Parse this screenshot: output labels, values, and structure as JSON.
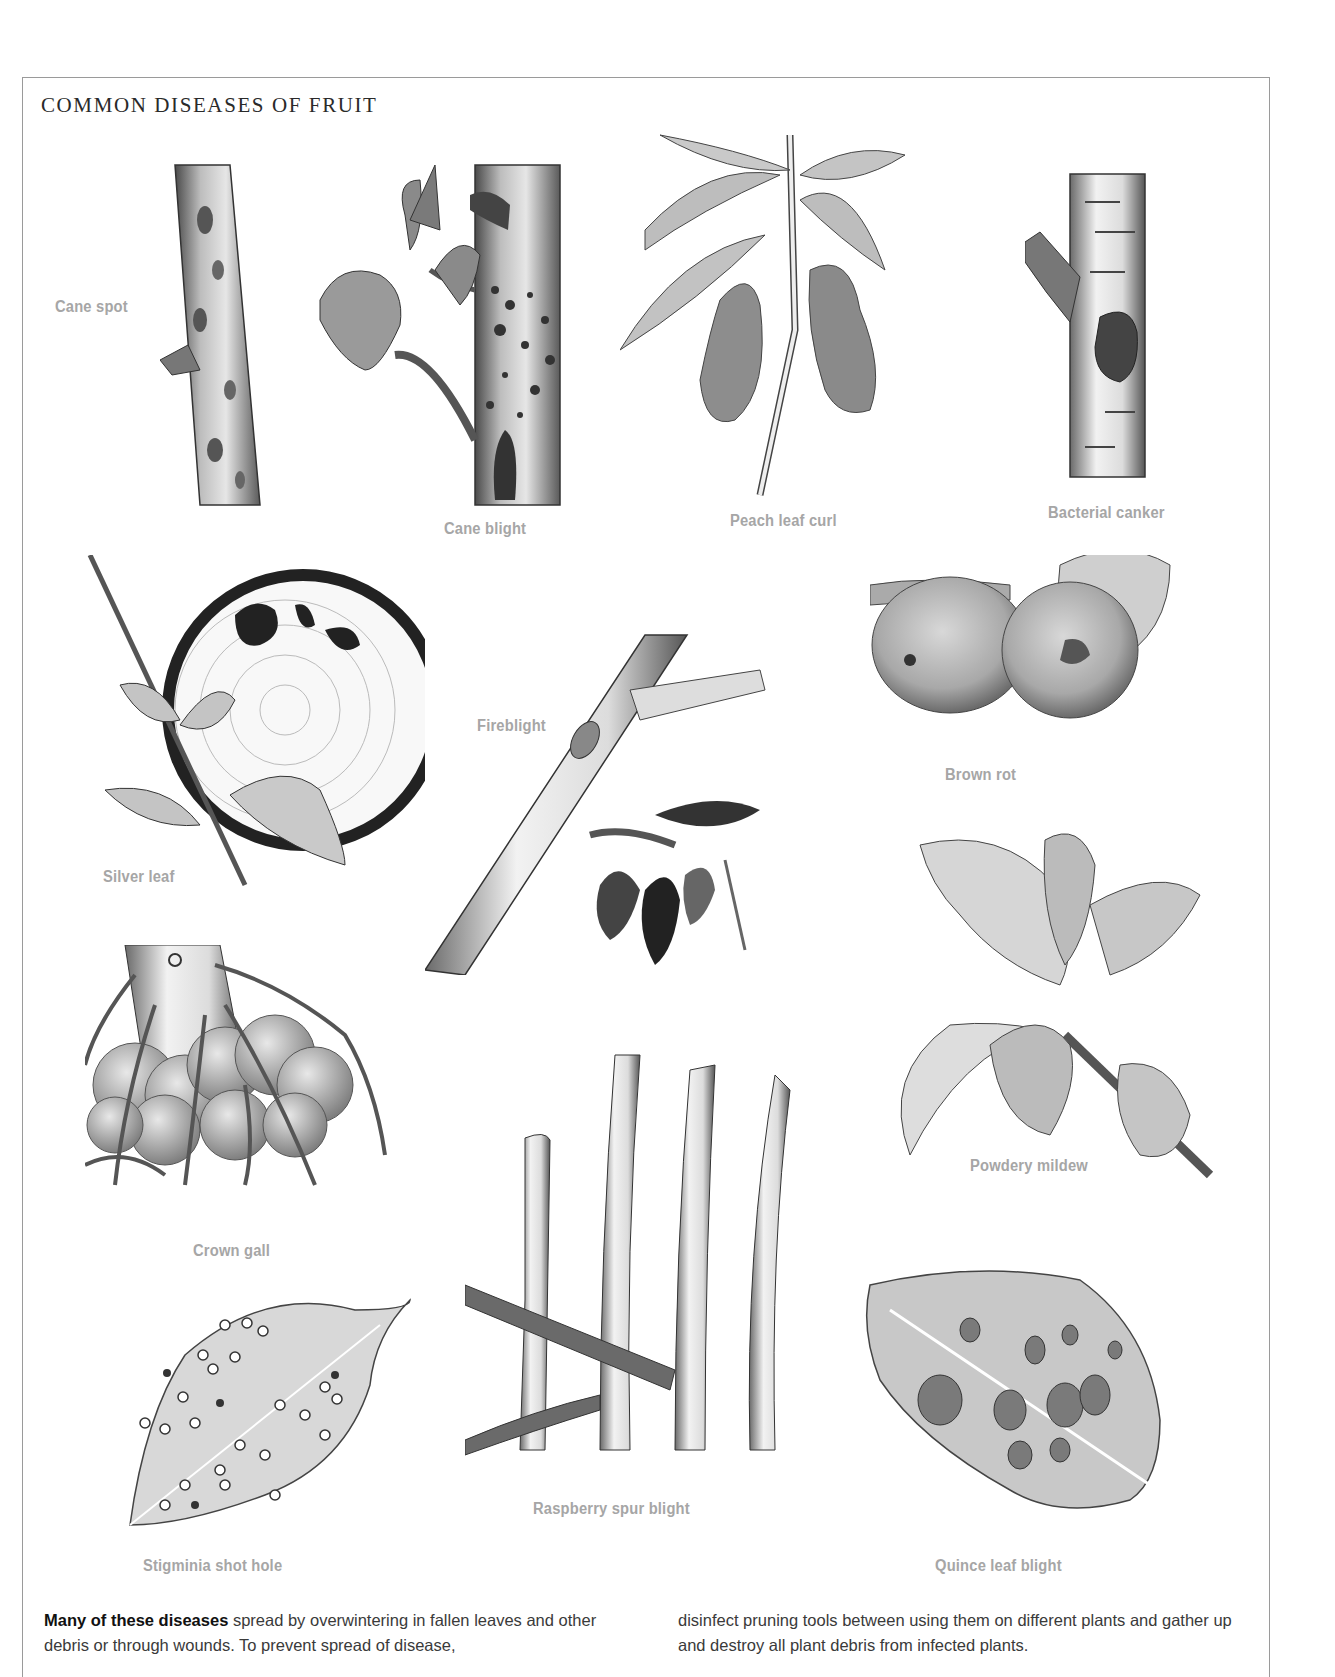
{
  "page": {
    "title": "COMMON DISEASES OF FRUIT",
    "label_color": "#a6a6a6",
    "border_color": "#9a9a9a"
  },
  "diseases": [
    {
      "id": "cane-spot",
      "label": "Cane spot"
    },
    {
      "id": "cane-blight",
      "label": "Cane blight"
    },
    {
      "id": "peach-leaf-curl",
      "label": "Peach leaf curl"
    },
    {
      "id": "bacterial-canker",
      "label": "Bacterial canker"
    },
    {
      "id": "silver-leaf",
      "label": "Silver leaf"
    },
    {
      "id": "fireblight",
      "label": "Fireblight"
    },
    {
      "id": "brown-rot",
      "label": "Brown rot"
    },
    {
      "id": "powdery-mildew",
      "label": "Powdery mildew"
    },
    {
      "id": "crown-gall",
      "label": "Crown gall"
    },
    {
      "id": "raspberry-spur-blight",
      "label": "Raspberry spur blight"
    },
    {
      "id": "stigminia-shot-hole",
      "label": "Stigminia shot hole"
    },
    {
      "id": "quince-leaf-blight",
      "label": "Quince leaf blight"
    }
  ],
  "caption": {
    "bold_lead": "Many of these diseases",
    "left_text": " spread by overwintering in fallen leaves and other debris or through wounds. To prevent spread of disease,",
    "right_text": "disinfect pruning tools between using them on different plants and gather up and destroy all plant debris from infected plants."
  }
}
